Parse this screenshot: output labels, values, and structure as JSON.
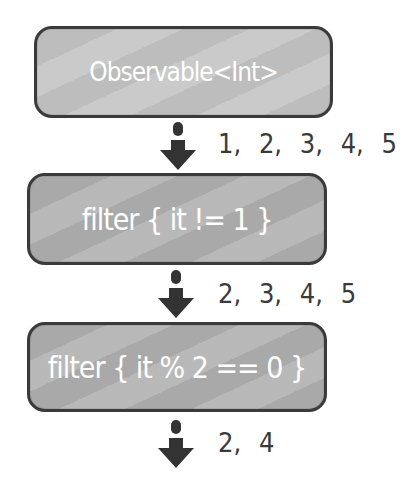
{
  "diagram": {
    "type": "flowchart",
    "nodes": [
      {
        "id": "source",
        "label": "Observable<Int>"
      },
      {
        "id": "filter1",
        "label": "filter { it != 1 }"
      },
      {
        "id": "filter2",
        "label": "filter { it % 2 == 0 }"
      }
    ],
    "edges": [
      {
        "from": "source",
        "to": "filter1",
        "values": "1, 2, 3, 4, 5"
      },
      {
        "from": "filter1",
        "to": "filter2",
        "values": "2, 3, 4, 5"
      },
      {
        "from": "filter2",
        "to": "output",
        "values": "2, 4"
      }
    ],
    "colors": {
      "box_fill": "#a9a9a9",
      "box_border": "#3a3a3a",
      "text": "#ffffff",
      "arrow": "#333333"
    }
  }
}
